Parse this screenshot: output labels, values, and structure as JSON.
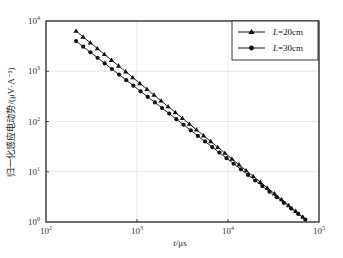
{
  "chart_data": {
    "type": "line",
    "title": "",
    "xlabel": "t/μs",
    "ylabel": "归一化感应电动势/(μV·A⁻¹)",
    "xscale": "log",
    "yscale": "log",
    "xlim": [
      100,
      100000
    ],
    "ylim": [
      1,
      10000
    ],
    "x_ticks": [
      {
        "base": "10",
        "exp": "2",
        "value": 100
      },
      {
        "base": "10",
        "exp": "3",
        "value": 1000
      },
      {
        "base": "10",
        "exp": "4",
        "value": 10000
      },
      {
        "base": "10",
        "exp": "5",
        "value": 100000
      }
    ],
    "y_ticks": [
      {
        "base": "10",
        "exp": "0",
        "value": 1
      },
      {
        "base": "10",
        "exp": "1",
        "value": 10
      },
      {
        "base": "10",
        "exp": "2",
        "value": 100
      },
      {
        "base": "10",
        "exp": "3",
        "value": 1000
      },
      {
        "base": "10",
        "exp": "4",
        "value": 10000
      }
    ],
    "grid": true,
    "legend_position": "upper right",
    "series": [
      {
        "name": "L=20cm",
        "label_italic": "L",
        "label_rest": "=20cm",
        "marker": "triangle",
        "color": "#111111",
        "x": [
          214,
          256,
          306,
          366,
          438,
          524,
          627,
          750,
          897,
          1073,
          1284,
          1536,
          1838,
          2199,
          2631,
          3148,
          3766,
          4506,
          5391,
          6450,
          7717,
          9233,
          11046,
          13216,
          15812,
          18918,
          22634,
          27079,
          32398,
          38761,
          46374,
          55483,
          66380
        ],
        "y": [
          6310,
          4620,
          3380,
          2480,
          1810,
          1330,
          971,
          711,
          520,
          381,
          279,
          204,
          149,
          109,
          80.0,
          58.6,
          42.9,
          31.4,
          23.0,
          16.8,
          12.3,
          9.02,
          6.6,
          4.83,
          3.54,
          2.59,
          1.9,
          1.39,
          1.02,
          0.75,
          0.55,
          0.4,
          1.26
        ]
      },
      {
        "name": "L=30cm",
        "label_italic": "L",
        "label_rest": "=30cm",
        "marker": "circle",
        "color": "#111111",
        "x": [
          214,
          256,
          306,
          366,
          438,
          524,
          627,
          750,
          897,
          1073,
          1284,
          1536,
          1838,
          2199,
          2631,
          3148,
          3766,
          4506,
          5391,
          6450,
          7717,
          9233,
          11046,
          13216,
          15812,
          18918,
          22634,
          27079,
          32398,
          38761,
          46374,
          55483,
          70795
        ],
        "y": [
          3980,
          2960,
          2200,
          1630,
          1210,
          900,
          669,
          497,
          369,
          274,
          204,
          151,
          112,
          83.4,
          62.0,
          46.0,
          34.2,
          25.4,
          18.9,
          14.0,
          10.4,
          7.74,
          5.75,
          4.27,
          3.17,
          2.36,
          1.75,
          1.3,
          0.97,
          0.72,
          0.53,
          0.4,
          1.12
        ]
      }
    ]
  },
  "axes": {
    "x_title_italic": "t",
    "x_title_rest": "/μs",
    "y_title": "归一化感应电动势/(μV·A⁻¹)"
  },
  "legend": {
    "items": [
      {
        "italic": "L",
        "rest": "=20cm"
      },
      {
        "italic": "L",
        "rest": "=30cm"
      }
    ]
  }
}
